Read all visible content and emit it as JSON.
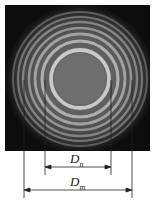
{
  "diagram": {
    "type": "newtons-rings-interference-pattern",
    "image": {
      "x": 5,
      "y": 5,
      "width": 145,
      "height": 146,
      "background": "#0d0d0d"
    },
    "rings_center": {
      "x": 80,
      "y": 79
    },
    "central_disk": {
      "radius": 26,
      "color": "#6e6e6e"
    },
    "bright_ring_radii": [
      29,
      38,
      45,
      51,
      57,
      62,
      67
    ],
    "outer_glow_radius": 72,
    "reference_lines": {
      "dn_left_x": 45,
      "dn_right_x": 111,
      "dn_top_y": 80,
      "dn_bottom_y": 175,
      "dm_left_x": 24,
      "dm_right_x": 132,
      "dm_top_y": 80,
      "dm_bottom_y": 198
    },
    "dimensions": [
      {
        "name": "Dn",
        "symbol": "D",
        "subscript": "n",
        "arrow_y": 167,
        "x1": 45,
        "x2": 111
      },
      {
        "name": "Dm",
        "symbol": "D",
        "subscript": "m",
        "arrow_y": 190,
        "x1": 24,
        "x2": 132
      }
    ]
  }
}
